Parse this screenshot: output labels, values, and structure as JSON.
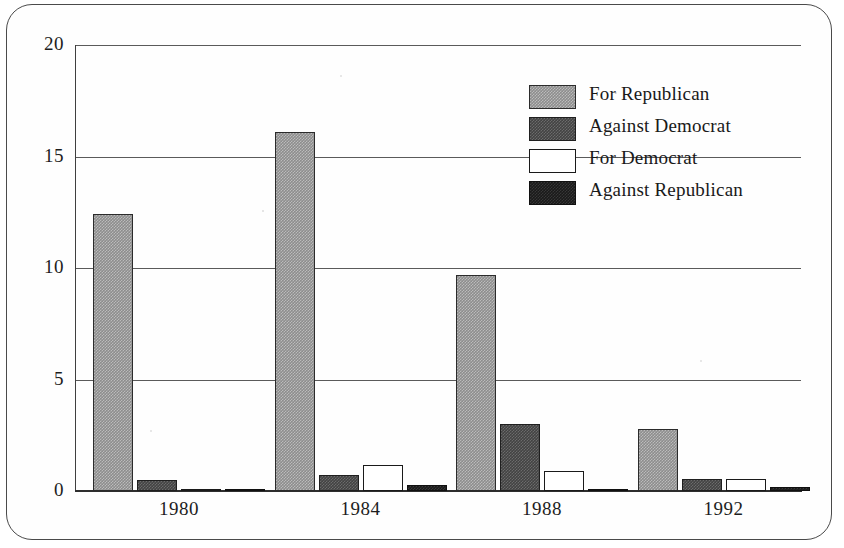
{
  "chart_data": {
    "type": "bar",
    "title": "",
    "xlabel": "",
    "ylabel": "",
    "categories": [
      "1980",
      "1984",
      "1988",
      "1992"
    ],
    "ylim": [
      0,
      20
    ],
    "yticks": [
      0,
      5,
      10,
      15,
      20
    ],
    "ytick_labels": [
      "0",
      "5",
      "10",
      "15",
      "20"
    ],
    "grid": true,
    "legend_position": "upper right",
    "series": [
      {
        "name": "For Republican",
        "color": "#8d8d8d",
        "values": [
          12.4,
          16.1,
          9.7,
          2.8
        ]
      },
      {
        "name": "Against Democrat",
        "color": "#434343",
        "values": [
          0.5,
          0.7,
          3.0,
          0.55
        ]
      },
      {
        "name": "For Democrat",
        "color": "#ffffff",
        "values": [
          0.1,
          1.15,
          0.9,
          0.55
        ]
      },
      {
        "name": "Against Republican",
        "color": "#1a1a1a",
        "values": [
          0.1,
          0.25,
          0.1,
          0.2
        ]
      }
    ]
  },
  "axes": {
    "y_ticks": [
      {
        "label": "20",
        "value": 20
      },
      {
        "label": "15",
        "value": 15
      },
      {
        "label": "10",
        "value": 10
      },
      {
        "label": "5",
        "value": 5
      },
      {
        "label": "0",
        "value": 0
      }
    ],
    "x_ticks": [
      {
        "label": "1980"
      },
      {
        "label": "1984"
      },
      {
        "label": "1988"
      },
      {
        "label": "1992"
      }
    ]
  },
  "legend": {
    "items": [
      {
        "label": "For Republican",
        "swatch": "for-republican-swatch"
      },
      {
        "label": "Against Democrat",
        "swatch": "against-democrat-swatch"
      },
      {
        "label": "For Democrat",
        "swatch": "for-democrat-swatch"
      },
      {
        "label": "Against Republican",
        "swatch": "against-republican-swatch"
      }
    ]
  }
}
